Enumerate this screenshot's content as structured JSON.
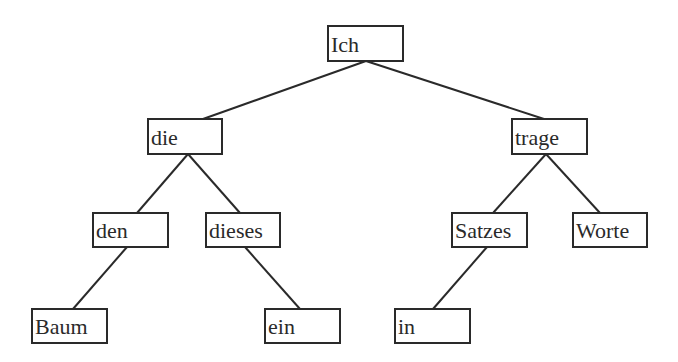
{
  "diagram": {
    "type": "tree",
    "colors": {
      "line": "#2a2a2a",
      "background": "#ffffff"
    },
    "nodes": [
      {
        "id": "ich",
        "label": "Ich",
        "x": 328,
        "y": 26,
        "w": 75,
        "h": 35
      },
      {
        "id": "die",
        "label": "die",
        "x": 148,
        "y": 119,
        "w": 74,
        "h": 35
      },
      {
        "id": "trage",
        "label": "trage",
        "x": 512,
        "y": 119,
        "w": 75,
        "h": 35
      },
      {
        "id": "den",
        "label": "den",
        "x": 93,
        "y": 213,
        "w": 75,
        "h": 34
      },
      {
        "id": "dieses",
        "label": "dieses",
        "x": 206,
        "y": 213,
        "w": 74,
        "h": 34
      },
      {
        "id": "satzes",
        "label": "Satzes",
        "x": 452,
        "y": 213,
        "w": 75,
        "h": 34
      },
      {
        "id": "worte",
        "label": "Worte",
        "x": 573,
        "y": 213,
        "w": 74,
        "h": 34
      },
      {
        "id": "baum",
        "label": "Baum",
        "x": 32,
        "y": 309,
        "w": 75,
        "h": 34
      },
      {
        "id": "ein",
        "label": "ein",
        "x": 265,
        "y": 309,
        "w": 75,
        "h": 34
      },
      {
        "id": "in",
        "label": "in",
        "x": 395,
        "y": 309,
        "w": 75,
        "h": 34
      }
    ],
    "edges": [
      {
        "from": "ich",
        "to": "die",
        "x1": 366,
        "y1": 61,
        "x2": 203,
        "y2": 119
      },
      {
        "from": "ich",
        "to": "trage",
        "x1": 366,
        "y1": 61,
        "x2": 544,
        "y2": 119
      },
      {
        "from": "die",
        "to": "den",
        "x1": 188,
        "y1": 154,
        "x2": 137,
        "y2": 213
      },
      {
        "from": "die",
        "to": "dieses",
        "x1": 188,
        "y1": 154,
        "x2": 240,
        "y2": 213
      },
      {
        "from": "trage",
        "to": "satzes",
        "x1": 546,
        "y1": 154,
        "x2": 493,
        "y2": 213
      },
      {
        "from": "trage",
        "to": "worte",
        "x1": 546,
        "y1": 154,
        "x2": 600,
        "y2": 213
      },
      {
        "from": "den",
        "to": "baum",
        "x1": 127,
        "y1": 247,
        "x2": 73,
        "y2": 309
      },
      {
        "from": "dieses",
        "to": "ein",
        "x1": 245,
        "y1": 247,
        "x2": 300,
        "y2": 309
      },
      {
        "from": "satzes",
        "to": "in",
        "x1": 487,
        "y1": 247,
        "x2": 433,
        "y2": 309
      }
    ]
  }
}
